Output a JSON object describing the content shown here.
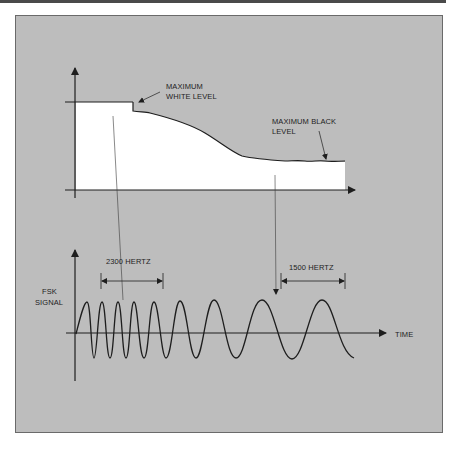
{
  "diagram": {
    "colors": {
      "panel": "#bdbdbd",
      "border": "#6a6a6a",
      "fill": "#ffffff",
      "ink": "#1e1e1e",
      "topbar": "#4a4a4a"
    },
    "top_graph": {
      "label_white": [
        "MAXIMUM",
        "WHITE LEVEL"
      ],
      "label_black": [
        "MAXIMUM BLACK",
        "LEVEL"
      ]
    },
    "bottom_graph": {
      "y_label": [
        "FSK",
        "SIGNAL"
      ],
      "x_label": "TIME",
      "freq_high": "2300 HERTZ",
      "freq_low": "1500 HERTZ"
    }
  }
}
